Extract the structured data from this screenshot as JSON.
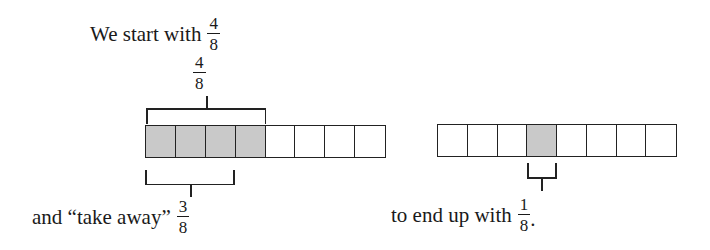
{
  "colors": {
    "shaded_fill": "#c9c9c9",
    "outline": "#222222",
    "text": "#1a1a1a",
    "background": "#ffffff"
  },
  "top_caption": {
    "text": "We start with",
    "fraction": {
      "numerator": "4",
      "denominator": "8"
    }
  },
  "top_brace_label": {
    "fraction": {
      "numerator": "4",
      "denominator": "8"
    }
  },
  "left_strip": {
    "total_cells": 8,
    "shaded_cells": [
      0,
      1,
      2,
      3
    ]
  },
  "right_strip": {
    "total_cells": 8,
    "shaded_cells": [
      3
    ]
  },
  "bottom_left_caption": {
    "text": "and “take away”",
    "fraction": {
      "numerator": "3",
      "denominator": "8"
    }
  },
  "bottom_right_caption": {
    "text": "to end up with",
    "fraction": {
      "numerator": "1",
      "denominator": "8"
    },
    "suffix": "."
  }
}
